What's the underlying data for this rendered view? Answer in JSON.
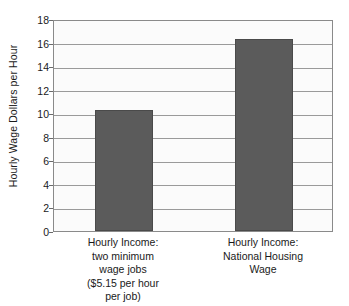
{
  "chart_data": {
    "type": "bar",
    "title": "",
    "xlabel": "",
    "ylabel": "Hourly Wage Dollars per Hour",
    "ylim": [
      0,
      18
    ],
    "yticks": [
      0,
      2,
      4,
      6,
      8,
      10,
      12,
      14,
      16,
      18
    ],
    "ytick_labels": [
      "0",
      "2",
      "4",
      "6",
      "8",
      "10",
      "12",
      "14",
      "16",
      "18"
    ],
    "grid": true,
    "legend": "none",
    "categories": [
      "Hourly Income: two minimum wage jobs ($5.15 per hour per job)",
      "Hourly Income: National Housing Wage"
    ],
    "category_lines": [
      [
        "Hourly Income:",
        "two minimum",
        "wage jobs",
        "($5.15 per hour",
        "per job)"
      ],
      [
        "Hourly Income:",
        "National Housing",
        "Wage"
      ]
    ],
    "values": [
      10.3,
      16.3
    ],
    "bar_color": "#5b5b5b",
    "plot_background": "#fbfbfb",
    "gridline_color": "#9a9a9a",
    "frame_color": "#8a8a8a"
  }
}
